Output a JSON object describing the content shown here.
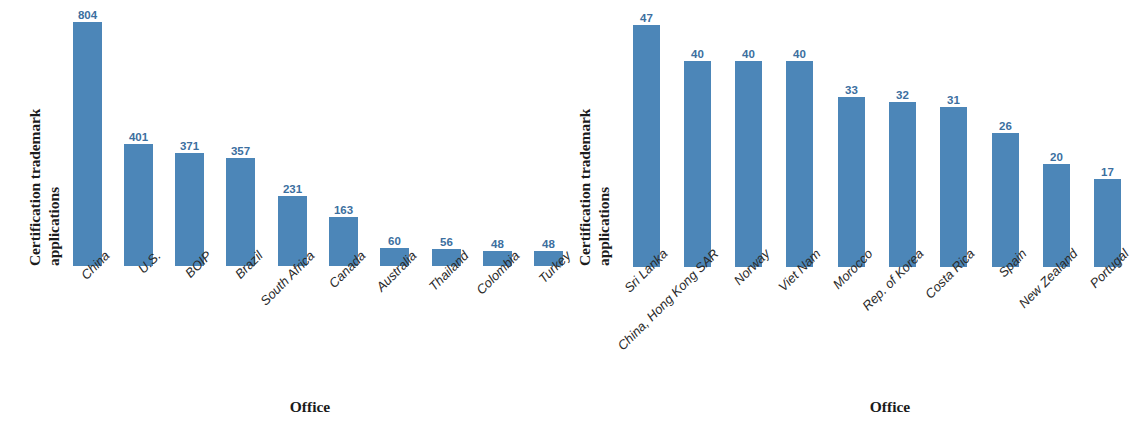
{
  "figure": {
    "background_color": "#ffffff",
    "bar_color": "#4c86b8",
    "value_label_color": "#3c6f9f",
    "axis_text_color": "#1b1b1b"
  },
  "panels": [
    {
      "id": "left",
      "ylabel_line1": "Certification trademark",
      "ylabel_line2": "applications",
      "xlabel": "Office"
    },
    {
      "id": "right",
      "ylabel_line1": "Certification trademark",
      "ylabel_line2": "applications",
      "xlabel": "Office"
    }
  ],
  "chart_data": [
    {
      "type": "bar",
      "title": "",
      "xlabel": "Office",
      "ylabel": "Certification trademark applications",
      "categories": [
        "China",
        "U.S.",
        "BOIP",
        "Brazil",
        "South Africa",
        "Canada",
        "Australia",
        "Thailand",
        "Colombia",
        "Turkey"
      ],
      "values": [
        804,
        401,
        371,
        357,
        231,
        163,
        60,
        56,
        48,
        48
      ],
      "ylim": [
        0,
        804
      ],
      "grid": false,
      "legend": false,
      "bar_color": "#4c86b8",
      "data_labels": [
        "804",
        "401",
        "371",
        "357",
        "231",
        "163",
        "60",
        "56",
        "48",
        "48"
      ]
    },
    {
      "type": "bar",
      "title": "",
      "xlabel": "Office",
      "ylabel": "Certification trademark applications",
      "categories": [
        "Sri Lanka",
        "China, Hong Kong SAR",
        "Norway",
        "Viet Nam",
        "Morocco",
        "Rep. of Korea",
        "Costa Rica",
        "Spain",
        "New Zealand",
        "Portugal"
      ],
      "values": [
        47,
        40,
        40,
        40,
        33,
        32,
        31,
        26,
        20,
        17
      ],
      "ylim": [
        0,
        47
      ],
      "grid": false,
      "legend": false,
      "bar_color": "#4c86b8",
      "data_labels": [
        "47",
        "40",
        "40",
        "40",
        "33",
        "32",
        "31",
        "26",
        "20",
        "17"
      ]
    }
  ]
}
